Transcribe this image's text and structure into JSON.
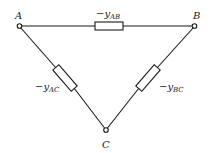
{
  "diagram": {
    "type": "delta-network",
    "nodes": [
      {
        "id": "A",
        "label": "A"
      },
      {
        "id": "B",
        "label": "B"
      },
      {
        "id": "C",
        "label": "C"
      }
    ],
    "branches": [
      {
        "from": "A",
        "to": "B",
        "prefix": "−y",
        "subscript": "AB"
      },
      {
        "from": "A",
        "to": "C",
        "prefix": "−y",
        "subscript": "AC"
      },
      {
        "from": "B",
        "to": "C",
        "prefix": "−y",
        "subscript": "BC"
      }
    ]
  }
}
